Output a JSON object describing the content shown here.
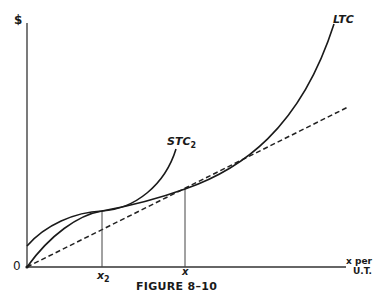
{
  "figure": {
    "caption": "FIGURE 8–10",
    "y_axis_label": "$",
    "origin_label": "0",
    "x_axis_label_line1": "x per",
    "x_axis_label_line2": "U.T.",
    "tick_labels": {
      "x2": "x",
      "x2_sub": "2",
      "x": "x"
    },
    "curves": {
      "ltc_label": "LTC",
      "stc_label": "STC",
      "stc_sub": "2"
    },
    "colors": {
      "ink": "#1a1a1a",
      "background": "#ffffff"
    }
  }
}
